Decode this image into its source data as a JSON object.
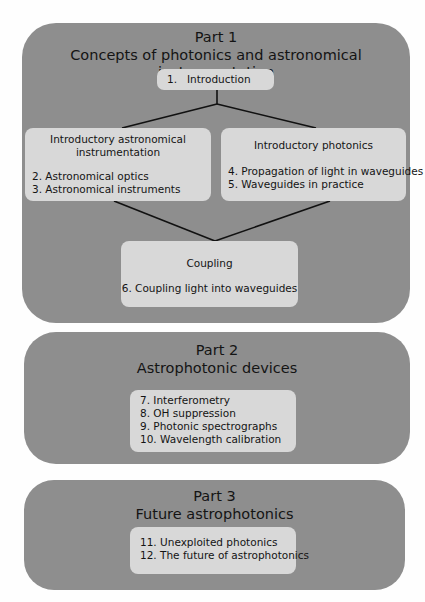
{
  "part1": {
    "label": "Part 1",
    "title": "Concepts of photonics and astronomical instrumentation",
    "intro": {
      "number": "1.",
      "title": "Introduction"
    },
    "left_group": {
      "heading_line1": "Introductory astronomical",
      "heading_line2": "instrumentation",
      "items": [
        "2. Astronomical optics",
        "3. Astronomical instruments"
      ]
    },
    "right_group": {
      "heading": "Introductory photonics",
      "items": [
        "4. Propagation of light in waveguides",
        "5. Waveguides in practice"
      ]
    },
    "coupling": {
      "heading": "Coupling",
      "items": [
        "6. Coupling light into waveguides"
      ]
    }
  },
  "part2": {
    "label": "Part 2",
    "title": "Astrophotonic devices",
    "items": [
      "7. Interferometry",
      "8. OH suppression",
      "9. Photonic spectrographs",
      "10. Wavelength calibration"
    ]
  },
  "part3": {
    "label": "Part 3",
    "title": "Future astrophotonics",
    "items": [
      "11. Unexploited photonics",
      "12. The future of astrophotonics"
    ]
  },
  "colors": {
    "panel": "#8e8e8e",
    "box": "#d8d8d8",
    "line": "#111111",
    "background": "#fefefe"
  }
}
